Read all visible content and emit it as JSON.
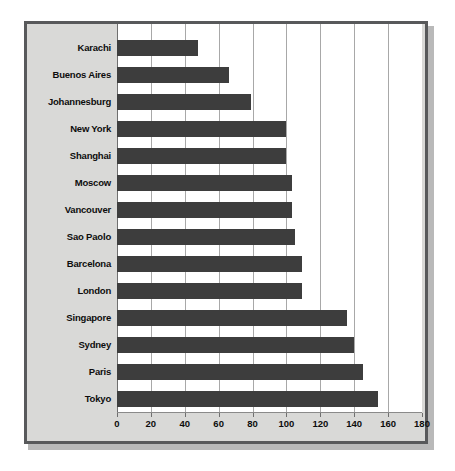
{
  "chart_data": {
    "type": "bar",
    "orientation": "horizontal",
    "title": "",
    "subtitle": "",
    "xlabel": "",
    "ylabel": "",
    "xlim": [
      0,
      180
    ],
    "ylim": null,
    "xticks": [
      0,
      20,
      40,
      60,
      80,
      100,
      120,
      140,
      160,
      180
    ],
    "xtick_labels": [
      "0",
      "20",
      "40",
      "60",
      "80",
      "100",
      "120",
      "140",
      "160",
      "180"
    ],
    "grid": "vertical",
    "legend": null,
    "legend_position": "none",
    "categories": [
      "Karachi",
      "Buenos Aires",
      "Johannesburg",
      "New York",
      "Shanghai",
      "Moscow",
      "Vancouver",
      "Sao Paolo",
      "Barcelona",
      "London",
      "Singapore",
      "Sydney",
      "Paris",
      "Tokyo"
    ],
    "values": [
      48,
      66,
      79,
      100,
      100,
      103,
      103,
      105,
      109,
      109,
      136,
      140,
      145,
      154
    ],
    "bar_color": "#3d3d3d",
    "plot_background": "#ffffff",
    "panel_background": "#d9d9d7",
    "gridline_color": "#a8a8a8",
    "frame_color": "#58595b"
  }
}
